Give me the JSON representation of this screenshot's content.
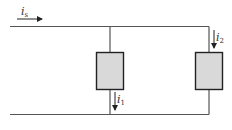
{
  "diagram": {
    "type": "parallel-circuit",
    "colors": {
      "wire": "#555555",
      "box_fill": "#d9d9d9",
      "box_stroke": "#222222",
      "text": "#333333"
    },
    "labels": {
      "source_current": {
        "main": "i",
        "sub": "s"
      },
      "branch1_current": {
        "main": "i",
        "sub": "1"
      },
      "branch2_current": {
        "main": "i",
        "sub": "2"
      }
    },
    "elements": [
      {
        "id": "element-1",
        "name": "Branch 1 element"
      },
      {
        "id": "element-2",
        "name": "Branch 2 element"
      }
    ]
  }
}
